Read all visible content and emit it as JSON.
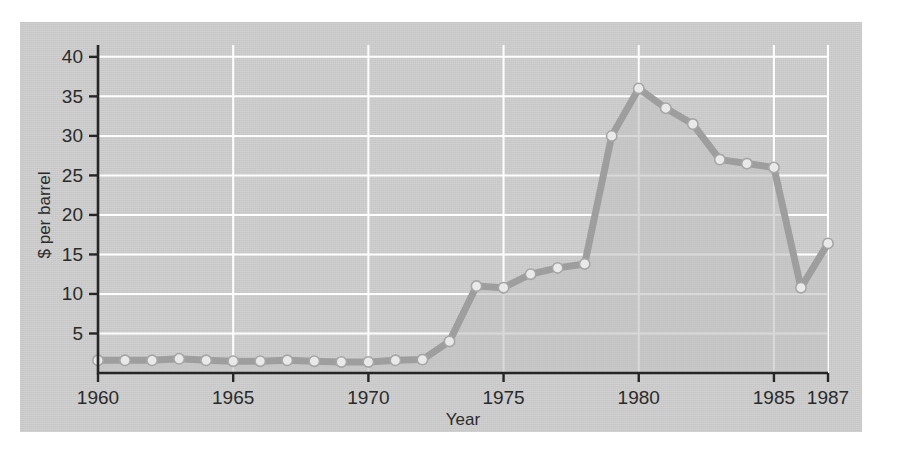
{
  "chart_data": {
    "type": "line",
    "title": "",
    "subtitle": "",
    "xlabel": "Year",
    "ylabel": "$ per barrel",
    "x": [
      1960,
      1961,
      1962,
      1963,
      1964,
      1965,
      1966,
      1967,
      1968,
      1969,
      1970,
      1971,
      1972,
      1973,
      1974,
      1975,
      1976,
      1977,
      1978,
      1979,
      1980,
      1981,
      1982,
      1983,
      1984,
      1985,
      1986,
      1987
    ],
    "values": [
      1.6,
      1.6,
      1.6,
      1.8,
      1.6,
      1.5,
      1.5,
      1.6,
      1.5,
      1.4,
      1.4,
      1.6,
      1.7,
      4.0,
      11.0,
      10.8,
      12.5,
      13.3,
      13.8,
      30.0,
      36.0,
      33.5,
      31.5,
      27.0,
      26.5,
      26.0,
      10.8,
      16.4
    ],
    "series": [
      {
        "name": "Crude oil price",
        "values": [
          1.6,
          1.6,
          1.6,
          1.8,
          1.6,
          1.5,
          1.5,
          1.6,
          1.5,
          1.4,
          1.4,
          1.6,
          1.7,
          4.0,
          11.0,
          10.8,
          12.5,
          13.3,
          13.8,
          30.0,
          36.0,
          33.5,
          31.5,
          27.0,
          26.5,
          26.0,
          10.8,
          16.4
        ]
      }
    ],
    "xlim": [
      1960,
      1987
    ],
    "ylim": [
      0,
      41.5
    ],
    "ytick_values": [
      5,
      10,
      15,
      20,
      25,
      30,
      35,
      40
    ],
    "ytick_labels": [
      "5",
      "10",
      "15",
      "20",
      "25",
      "30",
      "35",
      "40"
    ],
    "xtick_values": [
      1960,
      1965,
      1970,
      1975,
      1980,
      1985,
      1987
    ],
    "xtick_labels": [
      "1960",
      "1965",
      "1970",
      "1975",
      "1980",
      "1985",
      "1987"
    ],
    "grid": "horizontal-and-vertical-white",
    "legend": "none",
    "marker": "circle",
    "fill_below": true,
    "annotations": []
  },
  "style": {
    "panel_background": "#c9c9c9",
    "gridline_color": "#ffffff",
    "axis_color": "#262626",
    "line_color": "#9e9e9e",
    "marker_fill": "#e9e9e9",
    "marker_stroke": "#a6a6a6",
    "area_fill": "#c2c2c2",
    "text_color": "#2b2b2b",
    "page_background": "#ffffff"
  }
}
